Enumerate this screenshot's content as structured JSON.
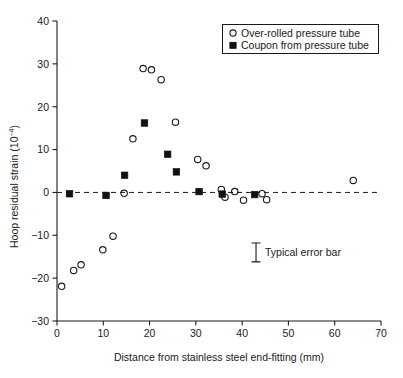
{
  "chart_data": {
    "type": "scatter",
    "title": "",
    "xlabel": "Distance from stainless steel end-fitting (mm)",
    "ylabel": "Hoop residual strain (10−4)",
    "ylabel_base": "Hoop residual strain (10",
    "ylabel_exp": "−4",
    "ylabel_tail": ")",
    "xlim": [
      0,
      70
    ],
    "ylim": [
      -30,
      40
    ],
    "xticks": [
      0,
      10,
      20,
      30,
      40,
      50,
      60,
      70
    ],
    "yticks": [
      -30,
      -20,
      -10,
      0,
      10,
      20,
      30,
      40
    ],
    "xtick_labels": [
      "0",
      "10",
      "20",
      "30",
      "40",
      "50",
      "60",
      "70"
    ],
    "ytick_labels": [
      "−30",
      "−20",
      "−10",
      "0",
      "10",
      "20",
      "30",
      "40"
    ],
    "grid": false,
    "zero_reference_line": {
      "value": 0,
      "style": "dashed",
      "label": "zero strain reference"
    },
    "legend": {
      "position": "top-right",
      "entries": [
        {
          "label": "Over-rolled pressure tube",
          "marker": "open-circle"
        },
        {
          "label": "Coupon from pressure tube",
          "marker": "filled-square"
        }
      ]
    },
    "annotations": [
      {
        "label": "Typical error bar",
        "x": 43.0,
        "y": -14.0,
        "half_height": 2.2
      }
    ],
    "series": [
      {
        "name": "Over-rolled pressure tube",
        "marker": "open-circle",
        "points": [
          {
            "x": 1.0,
            "y": -21.9
          },
          {
            "x": 3.6,
            "y": -18.2
          },
          {
            "x": 5.2,
            "y": -16.9
          },
          {
            "x": 9.9,
            "y": -13.4
          },
          {
            "x": 12.1,
            "y": -10.2
          },
          {
            "x": 14.5,
            "y": -0.2
          },
          {
            "x": 16.4,
            "y": 12.5
          },
          {
            "x": 18.6,
            "y": 28.9
          },
          {
            "x": 20.4,
            "y": 28.6
          },
          {
            "x": 22.5,
            "y": 26.3
          },
          {
            "x": 25.6,
            "y": 16.4
          },
          {
            "x": 30.4,
            "y": 7.7
          },
          {
            "x": 32.2,
            "y": 6.2
          },
          {
            "x": 35.5,
            "y": 0.7
          },
          {
            "x": 36.3,
            "y": -1.1
          },
          {
            "x": 38.4,
            "y": 0.2
          },
          {
            "x": 40.3,
            "y": -1.8
          },
          {
            "x": 44.3,
            "y": -0.3
          },
          {
            "x": 45.3,
            "y": -1.7
          },
          {
            "x": 64.0,
            "y": 2.8
          }
        ]
      },
      {
        "name": "Coupon from pressure tube",
        "marker": "filled-square",
        "points": [
          {
            "x": 2.7,
            "y": -0.3
          },
          {
            "x": 10.6,
            "y": -0.7
          },
          {
            "x": 14.6,
            "y": 4.0
          },
          {
            "x": 18.9,
            "y": 16.2
          },
          {
            "x": 23.9,
            "y": 8.9
          },
          {
            "x": 25.8,
            "y": 4.8
          },
          {
            "x": 30.7,
            "y": 0.2
          },
          {
            "x": 35.7,
            "y": -0.4
          },
          {
            "x": 42.7,
            "y": -0.5
          }
        ]
      }
    ]
  },
  "axes": {
    "x_axis_name": "x-axis",
    "y_axis_name": "y-axis"
  }
}
